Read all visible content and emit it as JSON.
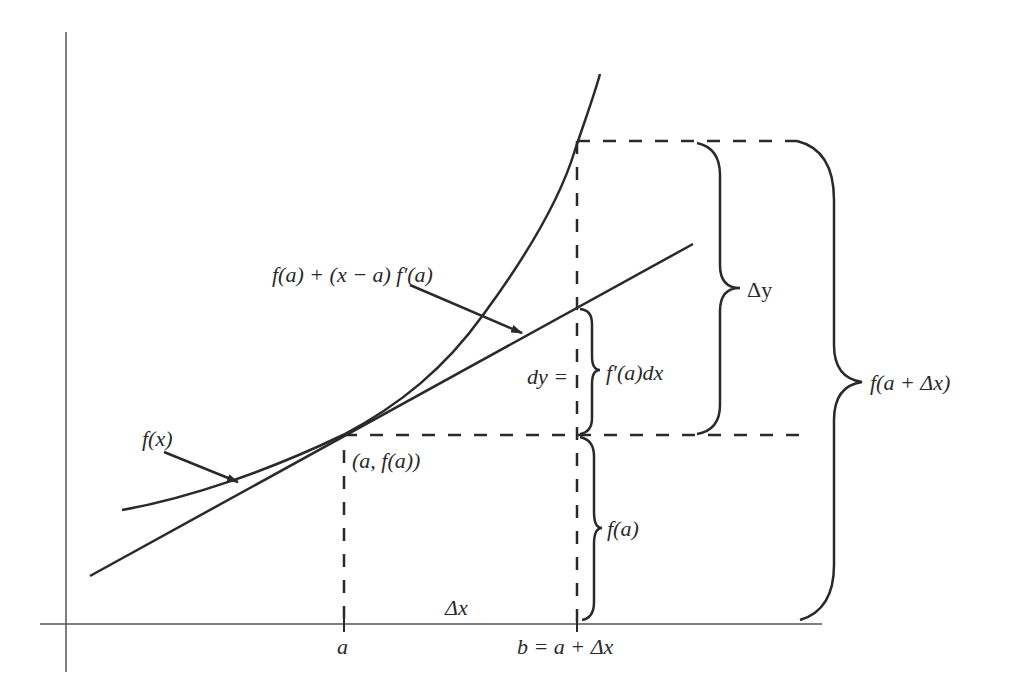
{
  "diagram": {
    "colors": {
      "stroke": "#2a2a2a",
      "axis": "#555555",
      "background": "#ffffff"
    },
    "labels": {
      "tangent": "f(a) + (x − a) f′(a)",
      "curve": "f(x)",
      "point": "(a, f(a))",
      "dy": "dy =",
      "dy_value": "f′(a)dx",
      "delta_y": "Δy",
      "f_a_plus": "f(a + Δx)",
      "f_a": "f(a)",
      "delta_x": "Δx",
      "tick_a": "a",
      "tick_b": "b = a + Δx"
    },
    "elements": {
      "axes": [
        "x-axis",
        "y-axis"
      ],
      "curve": "f(x), convex increasing",
      "tangent_line": "tangent at (a, f(a))",
      "dashed_guides": [
        "vertical at a",
        "vertical at b",
        "horizontal at f(a)",
        "horizontal at f(a+Δx)"
      ],
      "braces": [
        "dy",
        "Δy",
        "f(a+Δx)",
        "f(a)"
      ],
      "arrows": [
        "to curve f(x)",
        "to tangent line"
      ]
    }
  }
}
